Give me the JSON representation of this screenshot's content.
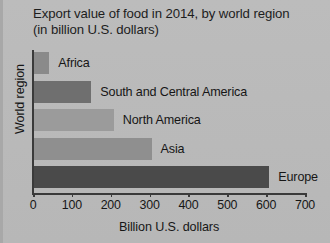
{
  "chart_data": {
    "type": "bar",
    "orientation": "horizontal",
    "title": "Export value of food in 2014, by world region (in billion U.S. dollars)",
    "xlabel": "Billion U.S. dollars",
    "ylabel": "World region",
    "categories": [
      "Africa",
      "South and Central America",
      "North America",
      "Asia",
      "Europe"
    ],
    "values": [
      42,
      150,
      208,
      305,
      608
    ],
    "xlim": [
      0,
      700
    ],
    "xticks": [
      0,
      100,
      200,
      300,
      400,
      500,
      600,
      700
    ],
    "xtick_labels": [
      "0",
      "100",
      "200",
      "300",
      "400",
      "500",
      "600",
      "700"
    ],
    "grid": false,
    "legend": "none",
    "bar_colors": [
      "#8a8a8a",
      "#6f6f6f",
      "#9b9b9b",
      "#8f8f8f",
      "#4a4a4a"
    ],
    "background_color": "#b9b9b9",
    "axis_color": "#3a3a3a",
    "text_color": "#161616"
  }
}
